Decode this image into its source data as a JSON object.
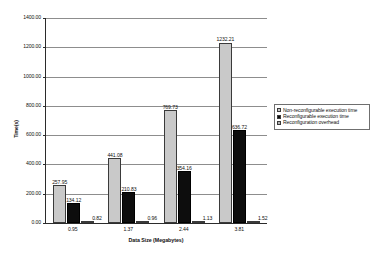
{
  "chart_data": {
    "type": "bar",
    "title": "",
    "xlabel": "Data Size (Megabytes)",
    "ylabel": "Time(s)",
    "categories": [
      "0.95",
      "1.37",
      "2.44",
      "3.81"
    ],
    "ylim": [
      0,
      1400
    ],
    "ytick_labels": [
      "1400.00",
      "1200.00",
      "1000.00",
      "800.00",
      "600.00",
      "400.00",
      "200.00",
      "0.00"
    ],
    "ytick_values": [
      1400,
      1200,
      1000,
      800,
      600,
      400,
      200,
      0
    ],
    "grid": true,
    "legend_position": "right",
    "series": [
      {
        "name": "Non-reconfigurable execution time",
        "color": "#c9c9c9",
        "values": [
          257.95,
          441.08,
          769.73,
          1232.21
        ],
        "labels": [
          "257.95",
          "441.08",
          "769.73",
          "1232.21"
        ]
      },
      {
        "name": "Reconfigurable execution time",
        "color": "#0d0d0d",
        "values": [
          134.12,
          210.83,
          354.16,
          636.72
        ],
        "labels": [
          "134.12",
          "210.83",
          "354.16",
          "636.72"
        ]
      },
      {
        "name": "Reconfiguration overhead",
        "color": "#b4b4b4",
        "values": [
          0.82,
          0.96,
          1.13,
          1.52
        ],
        "labels": [
          "0.82",
          "0.96",
          "1.13",
          "1.52"
        ]
      }
    ]
  }
}
